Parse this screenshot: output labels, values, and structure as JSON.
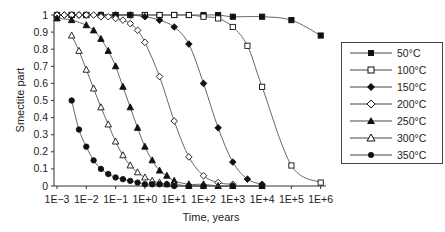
{
  "chart_data": {
    "type": "line",
    "title": "",
    "xlabel": "Time, years",
    "ylabel": "Smectite part",
    "xscale": "log",
    "xlim": [
      0.001,
      1000000
    ],
    "ylim": [
      0,
      1
    ],
    "x_tick_labels": [
      "1E−3",
      "1E−2",
      "1E−1",
      "1E+0",
      "1E+1",
      "1E+2",
      "1E+3",
      "1E+4",
      "1E+5",
      "1E+6"
    ],
    "y_tick_labels": [
      "0",
      "0.1",
      "0.2",
      "0.3",
      "0.4",
      "0.5",
      "0.6",
      "0.7",
      "0.8",
      "0.9",
      "1"
    ],
    "grid": false,
    "legend_position": "right",
    "series": [
      {
        "name": "50°C",
        "marker": "square-filled",
        "log_x": [
          -3,
          -2.5,
          -2,
          -1.5,
          -1,
          -0.5,
          0,
          0.5,
          1,
          1.5,
          2,
          2.5,
          3,
          4,
          5,
          6
        ],
        "values": [
          1,
          1,
          1,
          1,
          1,
          1,
          1,
          1,
          1,
          1,
          1,
          1,
          0.99,
          0.99,
          0.97,
          0.88
        ]
      },
      {
        "name": "100°C",
        "marker": "square-open",
        "log_x": [
          -3,
          -2.5,
          -2,
          -1.5,
          -1,
          -0.5,
          0,
          0.5,
          1,
          1.5,
          2,
          2.5,
          3,
          3.5,
          4,
          5,
          6
        ],
        "values": [
          1,
          1,
          1,
          1,
          1,
          1,
          1,
          1,
          1,
          1,
          0.99,
          0.98,
          0.93,
          0.82,
          0.58,
          0.12,
          0.02
        ]
      },
      {
        "name": "150°C",
        "marker": "diamond-filled",
        "log_x": [
          -3,
          -2.75,
          -2.5,
          -2.25,
          -2,
          -1.5,
          -1,
          -0.5,
          0,
          0.5,
          1,
          1.5,
          2,
          2.5,
          3,
          3.5,
          4
        ],
        "values": [
          1,
          1,
          1,
          1,
          1,
          1,
          1,
          1,
          0.99,
          0.97,
          0.93,
          0.83,
          0.6,
          0.34,
          0.14,
          0.04,
          0.01
        ]
      },
      {
        "name": "200°C",
        "marker": "diamond-open",
        "log_x": [
          -3,
          -2.75,
          -2.5,
          -2.25,
          -2,
          -1.75,
          -1.5,
          -1.25,
          -1,
          -0.75,
          -0.5,
          -0.25,
          0,
          0.5,
          1,
          1.5,
          2,
          2.5,
          3
        ],
        "values": [
          1,
          1,
          1,
          1,
          1,
          1,
          0.99,
          0.99,
          0.98,
          0.97,
          0.95,
          0.91,
          0.84,
          0.64,
          0.38,
          0.17,
          0.06,
          0.02,
          0.01
        ]
      },
      {
        "name": "250°C",
        "marker": "triangle-filled",
        "log_x": [
          -3,
          -2.5,
          -2,
          -1.75,
          -1.5,
          -1.25,
          -1,
          -0.75,
          -0.5,
          -0.25,
          0,
          0.25,
          0.5,
          0.75,
          1,
          1.5,
          2,
          2.5,
          3,
          4
        ],
        "values": [
          0.98,
          0.97,
          0.94,
          0.91,
          0.86,
          0.79,
          0.7,
          0.58,
          0.46,
          0.34,
          0.23,
          0.15,
          0.09,
          0.06,
          0.03,
          0.01,
          0.01,
          0,
          0,
          0
        ]
      },
      {
        "name": "300°C",
        "marker": "triangle-open",
        "log_x": [
          -2.5,
          -2.25,
          -2,
          -1.75,
          -1.5,
          -1.25,
          -1,
          -0.75,
          -0.5,
          -0.25,
          0,
          0.25,
          0.5,
          0.75,
          1,
          1.5,
          2
        ],
        "values": [
          0.88,
          0.79,
          0.68,
          0.57,
          0.46,
          0.36,
          0.26,
          0.18,
          0.12,
          0.08,
          0.05,
          0.03,
          0.02,
          0.01,
          0.01,
          0,
          0
        ]
      },
      {
        "name": "350°C",
        "marker": "circle-filled",
        "log_x": [
          -2.5,
          -2.25,
          -2,
          -1.75,
          -1.5,
          -1.25,
          -1,
          -0.75,
          -0.5,
          -0.25,
          0,
          0.25,
          0.5,
          0.75,
          1,
          1.5,
          2,
          3,
          4
        ],
        "values": [
          0.5,
          0.33,
          0.23,
          0.15,
          0.1,
          0.07,
          0.05,
          0.04,
          0.03,
          0.02,
          0.01,
          0.01,
          0.01,
          0.01,
          0,
          0,
          0,
          0,
          0
        ]
      }
    ]
  },
  "legend": {
    "items": [
      {
        "label": "50°C"
      },
      {
        "label": "100°C"
      },
      {
        "label": "150°C"
      },
      {
        "label": "200°C"
      },
      {
        "label": "250°C"
      },
      {
        "label": "300°C"
      },
      {
        "label": "350°C"
      }
    ]
  },
  "colors": {
    "line": "#555555",
    "marker": "#111111",
    "axis": "#333333"
  }
}
